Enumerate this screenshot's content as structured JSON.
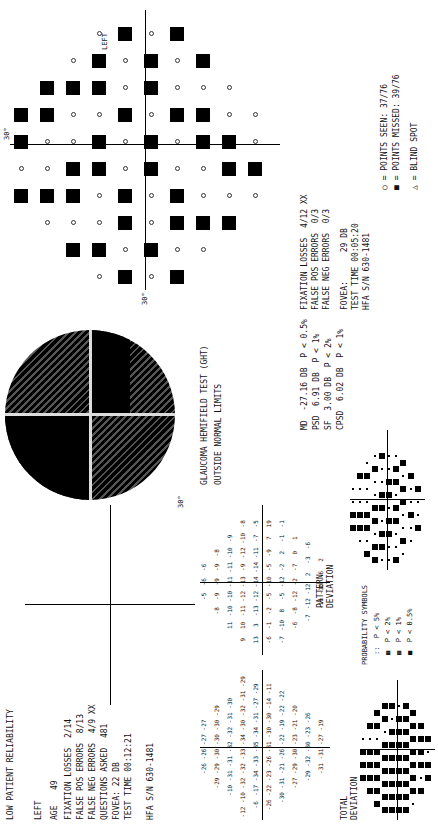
{
  "left_panel": {
    "reliability_note": "LOW PATIENT RELIABILITY",
    "eye": "LEFT",
    "age_label": "AGE",
    "age_value": "49",
    "fixation_losses": "FIXATION LOSSES  2/14",
    "false_pos": "FALSE POS ERRORS  8/13",
    "false_neg": "FALSE NEG ERRORS  4/9 XX",
    "questions_asked": "QUESTIONS ASKED  481",
    "fovea": "FOVEA: 22 DB",
    "test_time": "TEST TIME 00:12:21",
    "serial": "HFA S/N 630-1481",
    "total_deviation_label": "TOTAL\nDEVIATION",
    "pattern_deviation_label": "PATTERN\nDEVIATION"
  },
  "gray_scale": {
    "label_30": "30°"
  },
  "ght": {
    "title": "GLAUCOMA HEMIFIELD TEST (GHT)",
    "result": "OUTSIDE NORMAL LIMITS"
  },
  "indices": [
    {
      "name": "MD",
      "value": "-27.16 DB",
      "p": "P < 0.5%"
    },
    {
      "name": "PSD",
      "value": "6.91 DB",
      "p": "P < 1%"
    },
    {
      "name": "SF",
      "value": "3.00 DB",
      "p": "P < 2%"
    },
    {
      "name": "CPSD",
      "value": "6.02 DB",
      "p": "P < 1%"
    }
  ],
  "probability_symbols": {
    "title": "PROBABILITY SYMBOLS",
    "items": [
      "::  P < 5%",
      "▦  P < 2%",
      "▩  P < 1%",
      "■  P < 0.5%"
    ]
  },
  "right_panel": {
    "eye": "LEFT",
    "fixation_losses": "FIXATION LOSSES  4/12 XX",
    "false_pos": "FALSE POS ERRORS  0/3",
    "false_neg": "FALSE NEG ERRORS  0/3",
    "fovea": "FOVEA:      29 DB",
    "test_time": "TEST TIME 00:05:20",
    "serial": "HFA S/N 630-1481",
    "axis_top": "30°",
    "axis_left": "30°",
    "legend_seen": "○ = POINTS SEEN: 37/76",
    "legend_missed": "■ = POINTS MISSED: 39/76",
    "legend_blind": "△ = BLIND SPOT"
  },
  "total_deviation_values": [
    [
      "-26",
      "-26",
      "-27",
      "-27"
    ],
    [
      "-29",
      "-29",
      "-30",
      "-30",
      "-30",
      "-29"
    ],
    [
      "-10",
      "-31",
      "-31",
      "-32",
      "-32",
      "-31",
      "-30"
    ],
    [
      "-12",
      "-10",
      "-32",
      "-32",
      "-33",
      "-34",
      "-30",
      "-32",
      "-31",
      "-29"
    ],
    [
      "-6",
      "-17",
      "-34",
      "-33",
      "-35",
      "-34",
      "-31",
      "-27",
      "-29"
    ],
    [
      "-26",
      "-22",
      "-23",
      "-26",
      "-31",
      "-30",
      "-30",
      "-14",
      "-11"
    ],
    [
      "-30",
      "-31",
      "-21",
      "-26",
      "-22",
      "-19",
      "-22",
      "-22"
    ],
    [
      "-27",
      "-29",
      "-30",
      "-23",
      "-21",
      "-20"
    ],
    [
      "-29",
      "-32",
      "-30",
      "-23",
      "-26"
    ],
    [
      "-31",
      "-31",
      "-27",
      "-19"
    ]
  ],
  "pattern_deviation_values": [
    [
      "-5",
      "-6",
      "-6"
    ],
    [
      "-8",
      "-9",
      "-9",
      "-9",
      "-8"
    ],
    [
      "11",
      "-10",
      "-10",
      "-11",
      "-11",
      "-10",
      "-9"
    ],
    [
      "9",
      "10",
      "-11",
      "-12",
      "-13",
      "-9",
      "-12",
      "-10",
      "-8"
    ],
    [
      "13",
      "3",
      "-13",
      "-12",
      "-14",
      "-14",
      "-11",
      "-7",
      "-5"
    ],
    [
      "-6",
      "-1",
      "-2",
      "-5",
      "-10",
      "-5",
      "-9",
      "7",
      "19"
    ],
    [
      "-7",
      "-10",
      "8",
      "-5",
      "-12",
      "-2",
      "2",
      "-1",
      "-1"
    ],
    [
      "-6",
      "-8",
      "-12",
      "-2",
      "-7",
      "0",
      "1"
    ],
    [
      "-7",
      "-12",
      "-12",
      "2",
      "-3",
      "-6"
    ],
    [
      "-10",
      "-10",
      "-6",
      "2"
    ]
  ],
  "caption": "FIG 3.14 ..."
}
